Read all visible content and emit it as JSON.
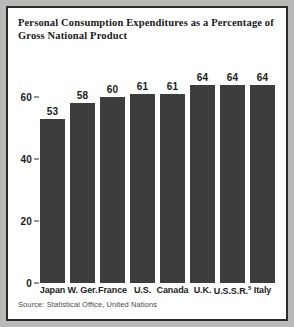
{
  "chart_data": {
    "type": "bar",
    "title": "Personal Consumption Expenditures as a Percentage of Gross National Product",
    "title_line1": "Personal Consumption Expenditures as a Percentage of",
    "title_line2": "Gross National Product",
    "categories": [
      "Japan",
      "W. Ger.",
      "France",
      "U.S.",
      "Canada",
      "U.K.",
      "U.S.S.R.",
      "Italy"
    ],
    "category_footnotes": [
      "",
      "",
      "",
      "",
      "",
      "",
      "5",
      ""
    ],
    "values": [
      53,
      58,
      60,
      61,
      61,
      64,
      64,
      64
    ],
    "xlabel": "",
    "ylabel": "",
    "ylim": [
      0,
      70
    ],
    "yticks": [
      0,
      20,
      40,
      60
    ],
    "ytick_labels": [
      "0",
      "20",
      "40",
      "60"
    ],
    "grid": false,
    "legend": "none",
    "source_note": "Source: Statistical Office, United Nations",
    "bar_color": "#3d3d3d",
    "background_color": "#ffffff",
    "frame_color": "#2b2b2b",
    "page_color": "#b9b9b7"
  }
}
